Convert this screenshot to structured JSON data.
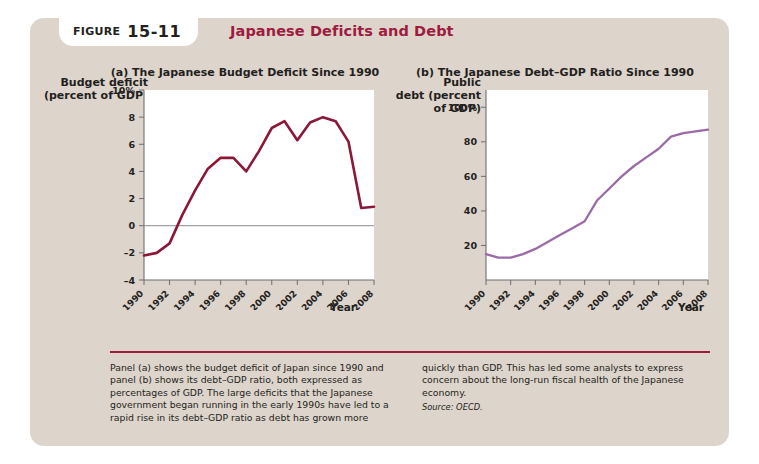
{
  "figure": {
    "badge_label": "FIGURE",
    "badge_number": "15-11",
    "title": "Japanese Deficits and Debt",
    "accent_color": "#9e1b40",
    "card_color": "#ddd4cb"
  },
  "caption": {
    "left": "Panel (a) shows the budget deficit of Japan since 1990 and panel (b) shows its debt–GDP ratio, both expressed as percentages of GDP. The large deficits that the Japanese government began running in the early 1990s have led to a rapid rise in its debt–GDP ratio as debt has grown more",
    "right": "quickly than GDP. This has led some analysts to express concern about the long-run fiscal health of the Japanese economy.",
    "source": "Source: OECD."
  },
  "chart_data": [
    {
      "type": "line",
      "panel": "a",
      "title": "(a) The Japanese Budget Deficit Since 1990",
      "ylabel": "Budget deficit\n(percent of GDP)",
      "xlabel": "Year",
      "line_color": "#8c1838",
      "ylim": [
        -4,
        10
      ],
      "yticks": [
        -4,
        -2,
        0,
        2,
        4,
        6,
        8,
        10
      ],
      "yticklabels": [
        "–4",
        "–2",
        "0",
        "2",
        "4",
        "6",
        "8",
        "10%"
      ],
      "xlim": [
        1990,
        2008
      ],
      "xticks": [
        1990,
        1992,
        1994,
        1996,
        1998,
        2000,
        2002,
        2004,
        2006,
        2008
      ],
      "xticklabels": [
        "1990",
        "1992",
        "1994",
        "1996",
        "1998",
        "2000",
        "2002",
        "2004",
        "2006",
        "2008"
      ],
      "grid": false,
      "zero_line": true,
      "x": [
        1990,
        1991,
        1992,
        1993,
        1994,
        1995,
        1996,
        1997,
        1998,
        1999,
        2000,
        2001,
        2002,
        2003,
        2004,
        2005,
        2006,
        2007,
        2008
      ],
      "values": [
        -2.2,
        -2.0,
        -1.3,
        0.8,
        2.6,
        4.2,
        5.0,
        5.0,
        4.0,
        5.5,
        7.2,
        7.7,
        6.3,
        7.6,
        8.0,
        7.7,
        6.2,
        1.3,
        1.4
      ]
    },
    {
      "type": "line",
      "panel": "b",
      "title": "(b) The Japanese Debt–GDP Ratio Since 1990",
      "ylabel": "Public\ndebt (percent\nof GDP)",
      "xlabel": "Year",
      "line_color": "#9b6ba8",
      "ylim": [
        0,
        110
      ],
      "yticks": [
        20,
        40,
        60,
        80,
        100
      ],
      "yticklabels": [
        "20",
        "40",
        "60",
        "80",
        "100%"
      ],
      "xlim": [
        1990,
        2008
      ],
      "xticks": [
        1990,
        1992,
        1994,
        1996,
        1998,
        2000,
        2002,
        2004,
        2006,
        2008
      ],
      "xticklabels": [
        "1990",
        "1992",
        "1994",
        "1996",
        "1998",
        "2000",
        "2002",
        "2004",
        "2006",
        "2008"
      ],
      "grid": false,
      "zero_line": false,
      "x": [
        1990,
        1991,
        1992,
        1993,
        1994,
        1995,
        1996,
        1997,
        1998,
        1999,
        2000,
        2001,
        2002,
        2003,
        2004,
        2005,
        2006,
        2007,
        2008
      ],
      "values": [
        15,
        13,
        13,
        15,
        18,
        22,
        26,
        30,
        34,
        46,
        53,
        60,
        66,
        71,
        76,
        83,
        85,
        86,
        87
      ]
    }
  ]
}
